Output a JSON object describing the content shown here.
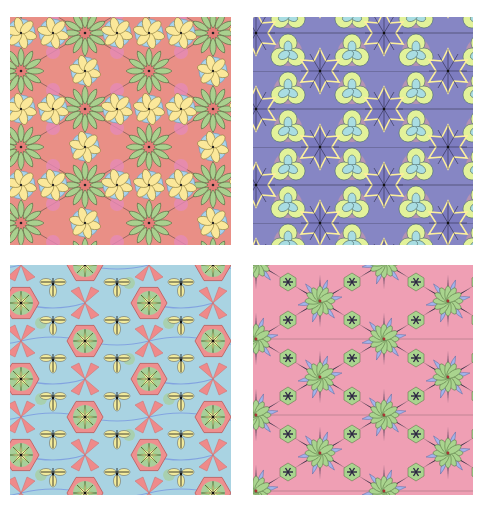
{
  "figure": {
    "layout": "2x2 grid",
    "panels": [
      {
        "id": "top-left",
        "description": "Hexagonal tiling with red-centered rosettes of green leaf petals and six-petal yellow flowers on light blue",
        "palette": {
          "background": "#e98f86",
          "petal_green": "#a9d08e",
          "flower_yellow": "#fbe89a",
          "flower_blue": "#a8d4ee",
          "accent_pink": "#e58ab7",
          "line": "#2b2b2b"
        }
      },
      {
        "id": "top-right",
        "description": "Hexagonal tiling with purple six-point stars outlined in yellow and yellow-green/cyan trefoil clusters",
        "palette": {
          "background": "#8686c4",
          "star_purple": "#7d7cc0",
          "outline_yellow": "#fcef9c",
          "cluster_yellowgreen": "#e2f29a",
          "cluster_cyan": "#a9dde2",
          "accent_pink": "#d49aa6",
          "line": "#222233"
        }
      },
      {
        "id": "bottom-left",
        "description": "Hexagonal tiling with pink hexagon medallions containing yellow-green starbursts, salmon X petals and trefoil yellow leaves on light blue",
        "palette": {
          "background": "#a9d3e2",
          "hexagon_pink": "#ee8f8f",
          "petal_salmon": "#ef8a8a",
          "leaf_yellow": "#f2eb9c",
          "accent_green": "#a8cf9a",
          "accent_blue": "#7d9ee0",
          "line": "#1f1f1f"
        }
      },
      {
        "id": "bottom-right",
        "description": "Hexagonal tiling with green petal rosettes, blue curved star arms, pink background and dark spikes",
        "palette": {
          "background": "#ef9fb4",
          "rosette_green": "#a9d48e",
          "arm_blue": "#a2b4ea",
          "spike_dark": "#2a2340",
          "line": "#333333"
        }
      }
    ],
    "lattice": {
      "period_x": 128,
      "period_y": 76
    }
  }
}
